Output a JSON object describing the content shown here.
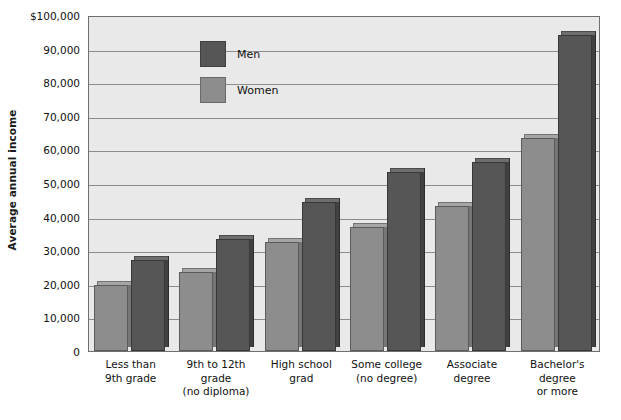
{
  "chart_data": {
    "type": "bar",
    "title": "",
    "xlabel": "",
    "ylabel": "Average annual income",
    "ylim": [
      0,
      100000
    ],
    "grid": true,
    "legend_position": "top-left inside plot",
    "categories": [
      "Less than\n9th grade",
      "9th to 12th\ngrade\n(no diploma)",
      "High school\ngrad",
      "Some college\n(no degree)",
      "Associate\ndegree",
      "Bachelor's\ndegree\nor more"
    ],
    "series": [
      {
        "name": "Women",
        "color": "#8d8d8d",
        "values": [
          19500,
          23500,
          32500,
          36800,
          43200,
          63500
        ]
      },
      {
        "name": "Men",
        "color": "#565656",
        "values": [
          27000,
          33200,
          44300,
          53300,
          56300,
          94000
        ]
      }
    ],
    "ticks": [
      {
        "value": 100000,
        "label": "$100,000"
      },
      {
        "value": 90000,
        "label": "90,000"
      },
      {
        "value": 80000,
        "label": "80,000"
      },
      {
        "value": 70000,
        "label": "70,000"
      },
      {
        "value": 60000,
        "label": "60,000"
      },
      {
        "value": 50000,
        "label": "50,000"
      },
      {
        "value": 40000,
        "label": "40,000"
      },
      {
        "value": 30000,
        "label": "30,000"
      },
      {
        "value": 20000,
        "label": "20,000"
      },
      {
        "value": 10000,
        "label": "10,000"
      },
      {
        "value": 0,
        "label": "0"
      }
    ]
  },
  "legend": {
    "items": [
      {
        "label": "Men",
        "key": "men"
      },
      {
        "label": "Women",
        "key": "women"
      }
    ]
  },
  "axis": {
    "y_title": "Average annual income"
  },
  "colors": {
    "men": "#565656",
    "women": "#8d8d8d",
    "plot_background": "#e9e9e9",
    "gridline": "#8c8c8c",
    "plot_border": "#6f6f6f"
  }
}
